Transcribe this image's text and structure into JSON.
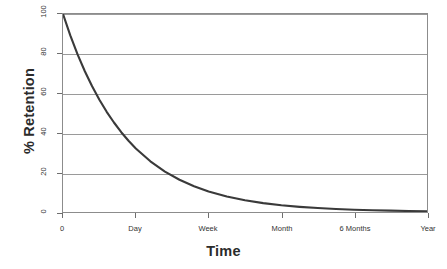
{
  "chart_data": {
    "type": "line",
    "title": "",
    "subtitle": "",
    "xlabel": "Time",
    "ylabel": "% Retention",
    "x_tick_labels": [
      "0",
      "Day",
      "Week",
      "Month",
      "6 Months",
      "Year"
    ],
    "x_tick_positions": [
      0,
      1,
      2,
      3,
      4,
      5
    ],
    "y_tick_labels": [
      "0",
      "20",
      "40",
      "60",
      "80",
      "100"
    ],
    "y_tick_values": [
      0,
      20,
      40,
      60,
      80,
      100
    ],
    "ylim": [
      0,
      100
    ],
    "xlim": [
      0,
      5
    ],
    "grid": "horizontal",
    "legend": "none",
    "line_color": "#3a3a3a",
    "line_width_px": 2,
    "series": [
      {
        "name": "Retention",
        "x": [
          0,
          0.1,
          0.2,
          0.3,
          0.4,
          0.5,
          0.6,
          0.7,
          0.8,
          0.9,
          1.0,
          1.2,
          1.4,
          1.6,
          1.8,
          2.0,
          2.25,
          2.5,
          2.75,
          3.0,
          3.25,
          3.5,
          3.75,
          4.0,
          4.25,
          4.5,
          4.75,
          5.0
        ],
        "values": [
          100,
          89.2,
          79.6,
          71.1,
          63.5,
          56.7,
          50.6,
          45.2,
          40.3,
          36.0,
          32.1,
          25.6,
          20.4,
          16.3,
          13.0,
          10.3,
          7.8,
          5.9,
          4.5,
          3.4,
          2.6,
          2.0,
          1.5,
          1.1,
          0.9,
          0.7,
          0.5,
          0.4
        ]
      }
    ],
    "annotations": []
  },
  "axes": {
    "y_title": "% Retention",
    "x_title": "Time"
  }
}
